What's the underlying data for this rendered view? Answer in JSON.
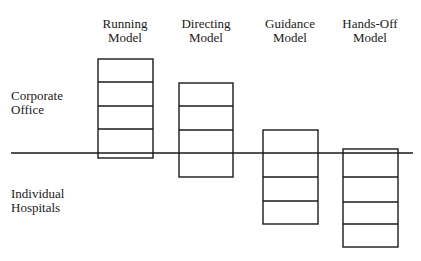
{
  "diagram": {
    "columns": [
      {
        "label_line1": "Running",
        "label_line2": "Model",
        "cells": 4
      },
      {
        "label_line1": "Directing",
        "label_line2": "Model",
        "cells": 4
      },
      {
        "label_line1": "Guidance",
        "label_line2": "Model",
        "cells": 4
      },
      {
        "label_line1": "Hands-Off",
        "label_line2": "Model",
        "cells": 4
      }
    ],
    "rows": {
      "above": {
        "line1": "Corporate",
        "line2": "Office"
      },
      "below": {
        "line1": "Individual",
        "line2": "Hospitals"
      }
    },
    "colors": {
      "stroke": "#1a1a1a",
      "background": "#ffffff"
    }
  }
}
